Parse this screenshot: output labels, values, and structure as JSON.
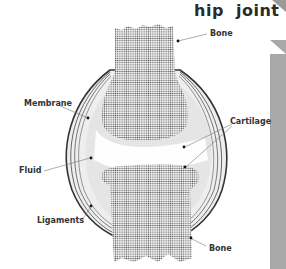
{
  "title": "hip  joint",
  "labels": {
    "bone_top": "Bone",
    "membrane": "Membrane",
    "cartilage": "Cartilage",
    "fluid": "Fluid",
    "ligaments": "Ligaments",
    "bone_bottom": "Bone"
  },
  "colors": {
    "bone_dots": "#555555",
    "fluid_fill": "#e2e2e2",
    "cartilage_fill": "#ffffff",
    "ligament_lines": "#333333",
    "side_bar": "#a8a8a8"
  }
}
